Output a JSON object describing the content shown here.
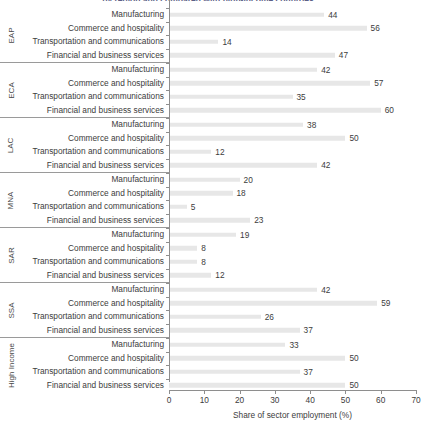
{
  "chart_data": {
    "type": "bar",
    "orientation": "horizontal",
    "title": "by region and compared with high-income countries",
    "xlabel": "Share of sector employment (%)",
    "ylabel": "",
    "xlim": [
      0,
      70
    ],
    "xticks": [
      0,
      10,
      20,
      30,
      40,
      50,
      60,
      70
    ],
    "grid": false,
    "legend": "none",
    "categories": [
      "Manufacturing",
      "Commerce and hospitality",
      "Transportation and communications",
      "Financial and business services"
    ],
    "groups": [
      {
        "name": "EAP",
        "values": [
          44,
          56,
          14,
          47
        ]
      },
      {
        "name": "ECA",
        "values": [
          42,
          57,
          35,
          60
        ]
      },
      {
        "name": "LAC",
        "values": [
          38,
          50,
          12,
          42
        ]
      },
      {
        "name": "MNA",
        "values": [
          20,
          18,
          5,
          23
        ]
      },
      {
        "name": "SAR",
        "values": [
          19,
          8,
          8,
          12
        ]
      },
      {
        "name": "SSA",
        "values": [
          42,
          59,
          26,
          37
        ]
      },
      {
        "name": "High Income",
        "values": [
          33,
          50,
          37,
          50
        ]
      }
    ],
    "colors": {
      "bar": "#e7e7e7",
      "axis": "#8e8e8e",
      "text": "#3c3c3c",
      "title": "#5d5f87"
    }
  }
}
